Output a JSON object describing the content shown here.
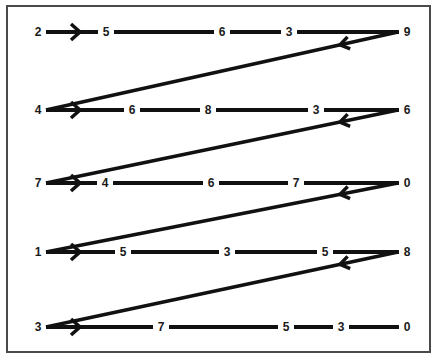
{
  "diagram": {
    "title": "",
    "type": "zigzag number sequence",
    "rows": [
      {
        "y": 32,
        "numbers": [
          {
            "v": "2",
            "x": 38
          },
          {
            "v": "5",
            "x": 106
          },
          {
            "v": "6",
            "x": 222
          },
          {
            "v": "3",
            "x": 289
          },
          {
            "v": "9",
            "x": 407
          }
        ]
      },
      {
        "y": 110,
        "numbers": [
          {
            "v": "4",
            "x": 38
          },
          {
            "v": "6",
            "x": 132
          },
          {
            "v": "8",
            "x": 208
          },
          {
            "v": "3",
            "x": 316
          },
          {
            "v": "6",
            "x": 407
          }
        ]
      },
      {
        "y": 183,
        "numbers": [
          {
            "v": "7",
            "x": 38
          },
          {
            "v": "4",
            "x": 105
          },
          {
            "v": "6",
            "x": 211
          },
          {
            "v": "7",
            "x": 296
          },
          {
            "v": "0",
            "x": 407
          }
        ]
      },
      {
        "y": 252,
        "numbers": [
          {
            "v": "1",
            "x": 38
          },
          {
            "v": "5",
            "x": 123
          },
          {
            "v": "3",
            "x": 227
          },
          {
            "v": "5",
            "x": 325
          },
          {
            "v": "8",
            "x": 407
          }
        ]
      },
      {
        "y": 327,
        "numbers": [
          {
            "v": "3",
            "x": 38
          },
          {
            "v": "7",
            "x": 161
          },
          {
            "v": "5",
            "x": 286
          },
          {
            "v": "3",
            "x": 341
          },
          {
            "v": "0",
            "x": 407
          }
        ]
      }
    ],
    "line_color": "#111111",
    "frame_color": "#4a4a4a"
  }
}
